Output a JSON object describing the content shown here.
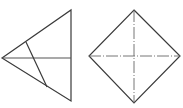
{
  "diagram": {
    "type": "geometry-figures",
    "stroke_color": "#3a3a3a",
    "figures": [
      {
        "name": "triangle",
        "vertices": [
          [
            2,
            58
          ],
          [
            71,
            10
          ],
          [
            71,
            101
          ]
        ],
        "lines": [
          {
            "name": "horizontal-median",
            "from": [
              2,
              58
            ],
            "to": [
              71,
              58
            ]
          },
          {
            "name": "inner-segment",
            "from": [
              26,
              42
            ],
            "to": [
              47,
              87
            ]
          }
        ]
      },
      {
        "name": "square-diamond",
        "vertices": [
          [
            134,
            10
          ],
          [
            180,
            56
          ],
          [
            134,
            103
          ],
          [
            89,
            56
          ]
        ],
        "lines": [
          {
            "name": "vertical-diagonal",
            "from": [
              134,
              10
            ],
            "to": [
              134,
              103
            ],
            "style": "dashdot"
          },
          {
            "name": "horizontal-diagonal",
            "from": [
              89,
              56
            ],
            "to": [
              180,
              56
            ],
            "style": "dashdot"
          }
        ]
      }
    ]
  }
}
